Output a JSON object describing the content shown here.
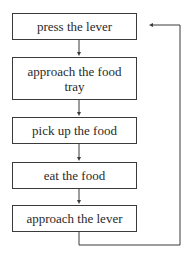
{
  "diagram": {
    "type": "flowchart-cycle",
    "steps": [
      {
        "label": "press the lever"
      },
      {
        "label": "approach the food tray"
      },
      {
        "label": "pick up the food"
      },
      {
        "label": "eat the food"
      },
      {
        "label": "approach the lever"
      }
    ],
    "loop": {
      "from": "approach the lever",
      "to": "press the lever"
    },
    "colors": {
      "line": "#3a3a3a",
      "text": "#2a2a2a",
      "background": "#ffffff"
    }
  }
}
